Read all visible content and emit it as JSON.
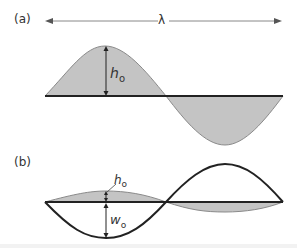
{
  "panels": {
    "a": {
      "label": "(a)",
      "wavelength_symbol": "λ",
      "amplitude_label": "h",
      "amplitude_subscript": "o"
    },
    "b": {
      "label": "(b)",
      "h_label": "h",
      "h_subscript": "o",
      "w_label": "w",
      "w_subscript": "o"
    }
  },
  "colors": {
    "fill": "#c4c4c4",
    "stroke": "#222222",
    "fill_edge": "#8a8a8a",
    "arrow": "#888888"
  }
}
